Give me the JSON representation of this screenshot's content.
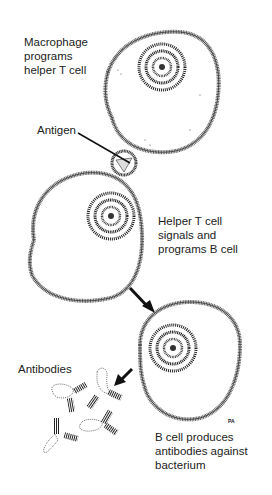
{
  "figure": {
    "type": "biological illustration"
  },
  "labels": {
    "macrophage": "Macrophage\nprograms\nhelper T cell",
    "antigen": "Antigen",
    "helper_t": "Helper T cell\nsignals and\nprograms B cell",
    "antibodies": "Antibodies",
    "b_cell": "B cell produces\nantibodies against\nbacterium",
    "signature": "PA"
  },
  "colors": {
    "ink": "#222222",
    "stipple": "#555555",
    "background": "#ffffff"
  }
}
